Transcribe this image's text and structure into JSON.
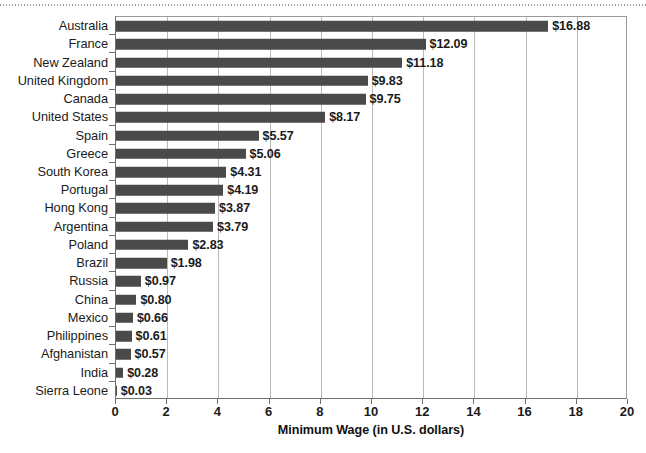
{
  "chart_data": {
    "type": "bar",
    "orientation": "horizontal",
    "title": "",
    "xlabel": "Minimum Wage (in U.S. dollars)",
    "ylabel": "",
    "xlim": [
      0,
      20
    ],
    "xticks": [
      0,
      2,
      4,
      6,
      8,
      10,
      12,
      14,
      16,
      18,
      20
    ],
    "xtick_labels": [
      "0",
      "2",
      "4",
      "6",
      "8",
      "10",
      "12",
      "14",
      "16",
      "18",
      "20"
    ],
    "grid": "vertical",
    "legend": null,
    "bar_color": "#4a4a4a",
    "categories": [
      "Australia",
      "France",
      "New Zealand",
      "United Kingdom",
      "Canada",
      "United States",
      "Spain",
      "Greece",
      "South Korea",
      "Portugal",
      "Hong Kong",
      "Argentina",
      "Poland",
      "Brazil",
      "Russia",
      "China",
      "Mexico",
      "Philippines",
      "Afghanistan",
      "India",
      "Sierra Leone"
    ],
    "values": [
      16.88,
      12.09,
      11.18,
      9.83,
      9.75,
      8.17,
      5.57,
      5.06,
      4.31,
      4.19,
      3.87,
      3.79,
      2.83,
      1.98,
      0.97,
      0.8,
      0.66,
      0.61,
      0.57,
      0.28,
      0.03
    ],
    "data_labels": [
      "$16.88",
      "$12.09",
      "$11.18",
      "$9.83",
      "$9.75",
      "$8.17",
      "$5.57",
      "$5.06",
      "$4.31",
      "$4.19",
      "$3.87",
      "$3.79",
      "$2.83",
      "$1.98",
      "$0.97",
      "$0.80",
      "$0.66",
      "$0.61",
      "$0.57",
      "$0.28",
      "$0.03"
    ]
  }
}
